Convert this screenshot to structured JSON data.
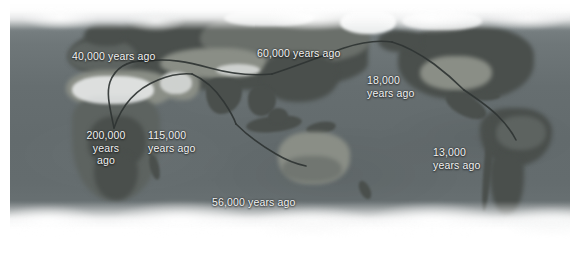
{
  "figure": {
    "name": "human-migration-world-map",
    "type": "annotated-satellite-world-map",
    "projection": "equirectangular",
    "palette": {
      "ocean": "#6a7274",
      "land": "#5d6360",
      "ice": "#ffffff",
      "route_line": "#2f3433",
      "label_text": "#f2f3f3"
    }
  },
  "labels": [
    {
      "id": "europe-40k",
      "text": "40,000 years ago",
      "region": "Europe",
      "years_ago": 40000,
      "x": 62,
      "y": 46,
      "align": "left",
      "width": 104
    },
    {
      "id": "asia-60k",
      "text": "60,000 years ago",
      "region": "Central Asia",
      "years_ago": 60000,
      "x": 257,
      "y": 43,
      "align": "left",
      "width": 104
    },
    {
      "id": "beringia-18k",
      "text": "18,000\nyears ago",
      "region": "Beringia",
      "years_ago": 18000,
      "x": 367,
      "y": 70,
      "align": "left",
      "width": 66
    },
    {
      "id": "africa-200k",
      "text": "200,000\nyears\nago",
      "region": "East Africa",
      "years_ago": 200000,
      "x": 70,
      "y": 125,
      "align": "center",
      "width": 60
    },
    {
      "id": "arabia-115k",
      "text": "115,000\nyears ago",
      "region": "Arabia / Levant",
      "years_ago": 115000,
      "x": 148,
      "y": 125,
      "align": "left",
      "width": 66
    },
    {
      "id": "samerica-13k",
      "text": "13,000\nyears ago",
      "region": "South America",
      "years_ago": 13000,
      "x": 433,
      "y": 142,
      "align": "left",
      "width": 66
    },
    {
      "id": "australia-56k",
      "text": "56,000 years ago",
      "region": "Australia",
      "years_ago": 56000,
      "x": 212,
      "y": 192,
      "align": "left",
      "width": 100
    }
  ],
  "routes": [
    {
      "id": "route-africa-to-europe",
      "from": "East Africa",
      "to": "Europe"
    },
    {
      "id": "route-africa-to-arabia",
      "from": "East Africa",
      "to": "Arabia"
    },
    {
      "id": "route-arabia-to-asia",
      "from": "Arabia",
      "to": "Central / East Asia"
    },
    {
      "id": "route-asia-to-australia",
      "from": "Southeast Asia",
      "to": "Australia"
    },
    {
      "id": "route-asia-to-beringia",
      "from": "Northeast Asia",
      "to": "Beringia"
    },
    {
      "id": "route-namerica-to-samerica",
      "from": "North America",
      "to": "South America"
    }
  ]
}
